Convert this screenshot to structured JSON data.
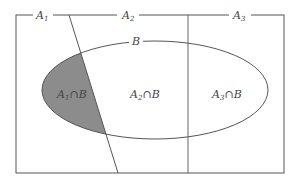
{
  "diagram": {
    "partition_labels": [
      {
        "main": "A",
        "sub": "1"
      },
      {
        "main": "A",
        "sub": "2"
      },
      {
        "main": "A",
        "sub": "3"
      }
    ],
    "set_label": "B",
    "regions": [
      {
        "main": "A",
        "sub": "1",
        "op": "∩",
        "set": "B",
        "shaded": true
      },
      {
        "main": "A",
        "sub": "2",
        "op": "∩",
        "set": "B",
        "shaded": false
      },
      {
        "main": "A",
        "sub": "3",
        "op": "∩",
        "set": "B",
        "shaded": false
      }
    ],
    "colors": {
      "line": "#555555",
      "shade": "#8c8c8c",
      "background": "#ffffff"
    }
  }
}
